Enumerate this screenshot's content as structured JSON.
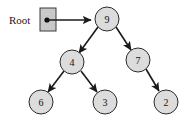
{
  "diagram": {
    "root_label": "Root",
    "colors": {
      "node_fill": "#dcdcdc",
      "node_stroke": "#2b2b2b",
      "edge": "#1a1a1a",
      "box_fill": "#c9c9c9",
      "box_stroke": "#3a3a3a",
      "background": "#ffffff",
      "text": "#111111"
    },
    "pointer": {
      "box": {
        "x": 40,
        "y": 8,
        "width": 16,
        "height": 23
      },
      "dot": {
        "cx": 47,
        "cy": 20,
        "r": 2.6
      },
      "arrow": {
        "x1": 47,
        "y1": 20,
        "x2": 93,
        "y2": 20
      }
    },
    "nodes": [
      {
        "id": "n9",
        "label": "9",
        "cx": 107,
        "cy": 19,
        "r": 12
      },
      {
        "id": "n4",
        "label": "4",
        "cx": 72,
        "cy": 62,
        "r": 12
      },
      {
        "id": "n7",
        "label": "7",
        "cx": 138,
        "cy": 60,
        "r": 12
      },
      {
        "id": "n6",
        "label": "6",
        "cx": 41,
        "cy": 102,
        "r": 12
      },
      {
        "id": "n3",
        "label": "3",
        "cx": 105,
        "cy": 102,
        "r": 12
      },
      {
        "id": "n2",
        "label": "2",
        "cx": 166,
        "cy": 102,
        "r": 12
      }
    ],
    "edges": [
      {
        "id": "e9-4",
        "from": "9",
        "to": "4",
        "x1": 98,
        "y1": 27,
        "x2": 80,
        "y2": 54
      },
      {
        "id": "e9-7",
        "from": "9",
        "to": "7",
        "x1": 116,
        "y1": 27,
        "x2": 131,
        "y2": 51
      },
      {
        "id": "e4-6",
        "from": "4",
        "to": "6",
        "x1": 64,
        "y1": 71,
        "x2": 48,
        "y2": 93
      },
      {
        "id": "e4-3",
        "from": "4",
        "to": "3",
        "x1": 81,
        "y1": 71,
        "x2": 97,
        "y2": 93
      },
      {
        "id": "e7-2",
        "from": "7",
        "to": "2",
        "x1": 146,
        "y1": 69,
        "x2": 159,
        "y2": 92
      }
    ]
  }
}
